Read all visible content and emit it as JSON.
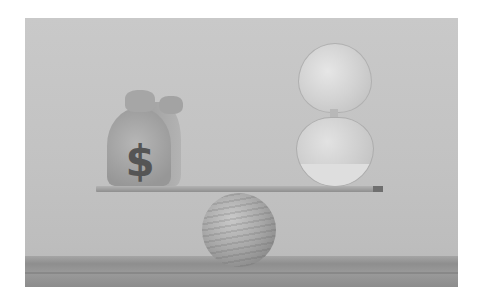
{
  "image": {
    "description": "Grayscale photo: a money bag with a dollar sign and an hourglass balanced on a thin plank resting on a wooden ball",
    "money_bag": {
      "symbol": "$"
    },
    "colors": {
      "background_margin": "#ffffff",
      "wall": "#c4c4c4",
      "floor": "#8e8e8e",
      "dollar_sign": "#555555"
    }
  }
}
